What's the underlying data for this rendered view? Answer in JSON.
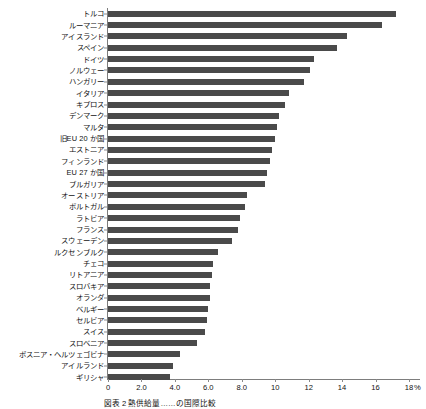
{
  "chart_data": {
    "type": "bar",
    "orientation": "horizontal",
    "title": "",
    "xlabel": "%",
    "ylabel": "",
    "xlim": [
      0,
      18.6
    ],
    "grid": false,
    "legend": null,
    "bar_color": "#4a4a4a",
    "axis_color": "#7d7d7d",
    "xticks": [
      {
        "value": 0,
        "label": "0"
      },
      {
        "value": 2,
        "label": "2.0"
      },
      {
        "value": 4,
        "label": "4.0"
      },
      {
        "value": 6,
        "label": "6.0"
      },
      {
        "value": 8,
        "label": "8.0"
      },
      {
        "value": 10,
        "label": "10"
      },
      {
        "value": 12,
        "label": "12"
      },
      {
        "value": 14,
        "label": "14"
      },
      {
        "value": 16,
        "label": "16"
      },
      {
        "value": 18,
        "label": "18"
      }
    ],
    "unit": "%",
    "categories": [
      "トルコ",
      "ルーマニア",
      "アイスランド",
      "スペイン",
      "ドイツ",
      "ノルウェー",
      "ハンガリー",
      "イタリア",
      "キプロス",
      "デンマーク",
      "マルタ",
      "旧EU 20 か国",
      "エストニア",
      "フィンランド",
      "EU 27 か国",
      "ブルガリア",
      "オーストリア",
      "ポルトガル",
      "ラトビア",
      "フランス",
      "スウェーデン",
      "ルクセンブルク",
      "チェコ",
      "リトアニア",
      "スロバキア",
      "オランダ",
      "ベルギー",
      "セルビア",
      "スイス",
      "スロベニア",
      "ボスニア・ヘルツェゴビナ",
      "アイルランド",
      "ギリシャ"
    ],
    "values": [
      17.2,
      16.4,
      14.3,
      13.7,
      12.3,
      12.1,
      11.7,
      10.8,
      10.6,
      10.2,
      10.1,
      10.0,
      9.8,
      9.7,
      9.5,
      9.4,
      8.3,
      8.2,
      7.9,
      7.8,
      7.4,
      6.6,
      6.3,
      6.2,
      6.1,
      6.1,
      6.0,
      5.9,
      5.8,
      5.3,
      4.3,
      3.9,
      3.7
    ]
  },
  "caption": {
    "text": "図表 2  熱供給量……の国際比較"
  }
}
